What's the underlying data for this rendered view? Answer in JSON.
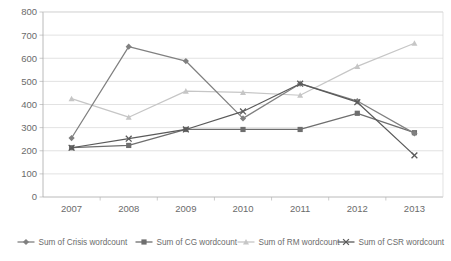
{
  "chart_data": {
    "type": "line",
    "title": "",
    "subtitle": "",
    "xlabel": "",
    "ylabel": "",
    "categories": [
      "2007",
      "2008",
      "2009",
      "2010",
      "2011",
      "2012",
      "2013"
    ],
    "x": [
      2007,
      2008,
      2009,
      2010,
      2011,
      2012,
      2013
    ],
    "ylim": [
      0,
      800
    ],
    "ytick_values": [
      0,
      100,
      200,
      300,
      400,
      500,
      600,
      700,
      800
    ],
    "ytick_labels": [
      "0",
      "100",
      "200",
      "300",
      "400",
      "500",
      "600",
      "700",
      "800"
    ],
    "grid": true,
    "grid_axis": "y",
    "legend_position": "bottom",
    "series": [
      {
        "name": "Sum of Crisis wordcount",
        "color": "#808080",
        "marker": "diamond",
        "values": [
          255,
          650,
          588,
          340,
          490,
          415,
          275
        ]
      },
      {
        "name": "Sum of CG wordcount",
        "color": "#6e6e6e",
        "marker": "square",
        "values": [
          213,
          223,
          292,
          292,
          292,
          362,
          278
        ]
      },
      {
        "name": "Sum of RM wordcount",
        "color": "#c6c6c6",
        "marker": "triangle",
        "values": [
          425,
          345,
          458,
          452,
          440,
          565,
          665
        ]
      },
      {
        "name": "Sum of CSR wordcount",
        "color": "#5a5a5a",
        "marker": "cross",
        "values": [
          213,
          252,
          292,
          370,
          490,
          410,
          180
        ]
      }
    ]
  },
  "legend": {
    "items": [
      {
        "label": "Sum of Crisis wordcount"
      },
      {
        "label": "Sum of CG wordcount"
      },
      {
        "label": "Sum of RM wordcount"
      },
      {
        "label": "Sum of CSR wordcount"
      }
    ]
  },
  "colors": {
    "grid": "#d6d6d6",
    "axis": "#a8a8a8",
    "text": "#6b6b6b",
    "background": "#ffffff"
  }
}
